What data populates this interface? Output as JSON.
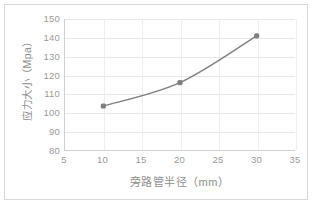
{
  "chart_data": {
    "type": "line",
    "title": "",
    "xlabel": "旁路管半径（mm）",
    "ylabel": "应力大小（Mpa）",
    "x": [
      10,
      20,
      30
    ],
    "values": [
      103.5,
      116,
      141
    ],
    "series": [
      {
        "name": "应力大小",
        "x": [
          10,
          20,
          30
        ],
        "values": [
          103.5,
          116,
          141
        ],
        "color": "#808080",
        "marker": "square-round",
        "smooth": true
      }
    ],
    "xlim": [
      5,
      35
    ],
    "ylim": [
      80,
      150
    ],
    "xticks": [
      5,
      10,
      15,
      20,
      25,
      30,
      35
    ],
    "yticks": [
      80,
      90,
      100,
      110,
      120,
      130,
      140,
      150
    ],
    "xtick_labels": [
      "5",
      "10",
      "15",
      "20",
      "25",
      "30",
      "35"
    ],
    "ytick_labels": [
      "80",
      "90",
      "100",
      "110",
      "120",
      "130",
      "140",
      "150"
    ],
    "grid": true,
    "grid_axes": "both",
    "legend": false,
    "legend_position": "none",
    "plot_background": "#ffffff",
    "grid_color": "#e8e8e8",
    "axis_color": "#d0d0d0",
    "tick_label_color": "#9a9a9a",
    "axis_title_color": "#8f8f8f",
    "frame_border_color": "#d9d9d9"
  }
}
